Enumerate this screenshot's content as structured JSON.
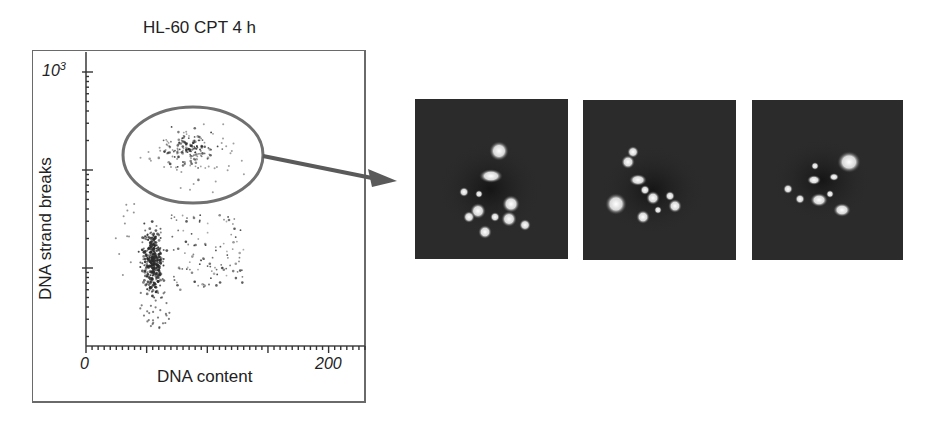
{
  "figure": {
    "title": "HL-60 CPT 4 h",
    "colors": {
      "background": "#ffffff",
      "axis": "#555555",
      "points": "#2a2a2a",
      "gate_ellipse": "#707070",
      "arrow": "#5a5a5a",
      "cell_panel_bg": "#2b2b2b"
    }
  },
  "chart_data": {
    "type": "scatter",
    "title": "HL-60 CPT 4 h",
    "xlabel": "DNA content",
    "ylabel": "DNA strand breaks",
    "x_ticks": [
      "0",
      "200"
    ],
    "y_ticks": [
      "10^3"
    ],
    "x_range": [
      0,
      230
    ],
    "y_scale": "log",
    "y_range_decades": [
      0.2,
      3.2
    ],
    "grid": false,
    "legend": null,
    "populations": [
      {
        "name": "G1 cluster (low strand breaks)",
        "x_center": 50,
        "y_center_log": 1.4,
        "density": "high"
      },
      {
        "name": "S/G2 spread",
        "x_range": [
          60,
          120
        ],
        "y_range_log": [
          1.0,
          1.9
        ],
        "density": "medium"
      },
      {
        "name": "Gated apoptotic population (high strand breaks)",
        "x_range": [
          45,
          125
        ],
        "y_range_log": [
          1.9,
          2.7
        ],
        "density": "medium",
        "gated": true
      }
    ],
    "annotations": [
      {
        "type": "ellipse-gate",
        "label": "high DNA strand breaks population"
      },
      {
        "type": "arrow",
        "from": "ellipse-gate",
        "to": "cell-images"
      }
    ]
  },
  "cell_images": {
    "count": 3,
    "description": "Fluorescence micrographs of gated cells showing fragmented nuclei (apoptotic bodies)"
  }
}
